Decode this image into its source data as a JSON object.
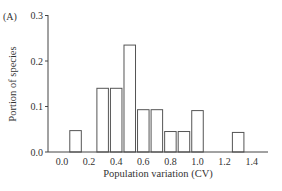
{
  "chart_data": {
    "type": "bar",
    "panel_label": "(A)",
    "title": "",
    "xlabel": "Population variation (CV)",
    "ylabel": "Portion of species",
    "xlim": [
      -0.1,
      1.5
    ],
    "ylim": [
      0.0,
      0.3
    ],
    "xticks": [
      "0.0",
      "0.2",
      "0.4",
      "0.6",
      "0.8",
      "1.0",
      "1.2",
      "1.4"
    ],
    "yticks": [
      "0.0",
      "0.1",
      "0.2",
      "0.3"
    ],
    "grid": false,
    "legend": null,
    "bar_width": 0.085,
    "categories": [
      0.1,
      0.3,
      0.4,
      0.5,
      0.6,
      0.7,
      0.8,
      0.9,
      1.0,
      1.3
    ],
    "values": [
      0.047,
      0.14,
      0.14,
      0.235,
      0.093,
      0.093,
      0.045,
      0.045,
      0.091,
      0.043
    ]
  }
}
